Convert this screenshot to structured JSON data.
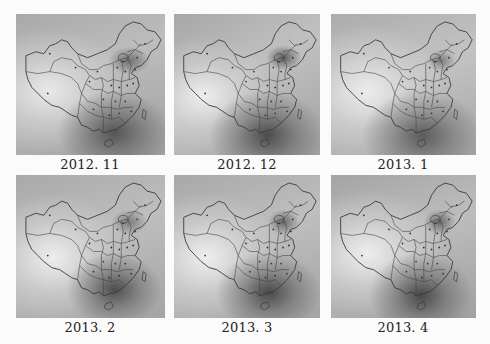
{
  "figure": {
    "type": "grid of interpolated grayscale maps of China",
    "layout": {
      "rows": 2,
      "columns": 3
    },
    "panels": [
      {
        "label": "2012. 11",
        "shading": "s-a"
      },
      {
        "label": "2012. 12",
        "shading": "s-b"
      },
      {
        "label": "2013. 1",
        "shading": "s-c"
      },
      {
        "label": "2013. 2",
        "shading": "s-d"
      },
      {
        "label": "2013. 3",
        "shading": "s-e"
      },
      {
        "label": "2013. 4",
        "shading": "s-f"
      }
    ],
    "colors": {
      "background": "#fbfbfb",
      "map_base": "#b9b9b9",
      "dark_region": "#4a4a4a",
      "light_region": "#eeeeee",
      "border_lines": "#3a3a3a"
    }
  }
}
